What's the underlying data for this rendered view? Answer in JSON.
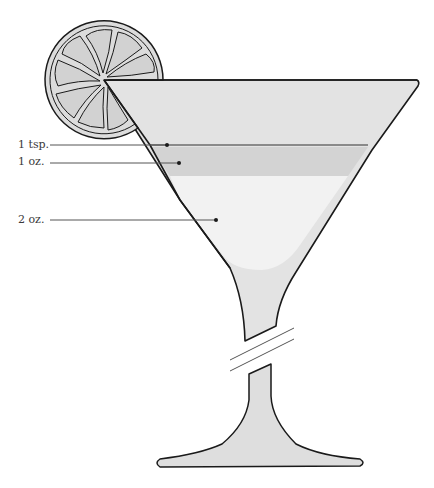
{
  "diagram": {
    "labels": [
      {
        "id": "tsp",
        "text": "1 tsp.",
        "label_y": 145,
        "dot_x": 167,
        "dot_y": 145
      },
      {
        "id": "oz1",
        "text": "1 oz.",
        "label_y": 162,
        "dot_x": 179,
        "dot_y": 163
      },
      {
        "id": "oz2",
        "text": "2 oz.",
        "label_y": 220,
        "dot_x": 216,
        "dot_y": 220
      }
    ],
    "layers": [
      {
        "name": "top-empty",
        "color": "#e2e2e2"
      },
      {
        "name": "1 tsp. line",
        "color": "#8a8a8a"
      },
      {
        "name": "1 oz. band",
        "color": "#d3d3d3"
      },
      {
        "name": "2 oz. fill",
        "color": "#f1f1f1"
      }
    ],
    "garnish": "lemon-wheel",
    "colors": {
      "outline": "#1a1a1a",
      "glass": "#e3e3e3",
      "lemon": "#dcdcdc",
      "leader": "#555555"
    }
  }
}
